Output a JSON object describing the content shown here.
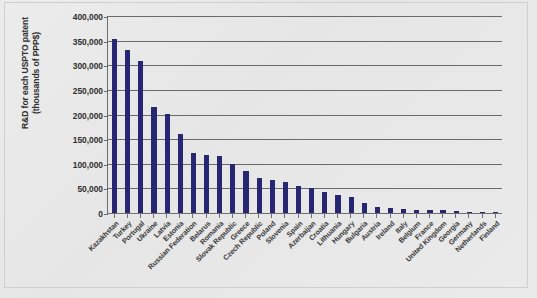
{
  "chart_data": {
    "type": "bar",
    "title": "",
    "xlabel": "",
    "ylabel": "R&D for each USPTO patent (thousands of PPP$)",
    "ylabel_line1": "R&D for each USPTO patent",
    "ylabel_line2": "(thousands of PPP$)",
    "ylim": [
      0,
      400000
    ],
    "ytick_step": 50000,
    "grid": true,
    "legend": "none",
    "bar_color": "#262673",
    "axis_color": "#6a6a6a",
    "ytick_labels": [
      "400,000",
      "350,000",
      "300,000",
      "250,000",
      "200,000",
      "150,000",
      "100,000",
      "50,000",
      "0"
    ],
    "ytick_values": [
      400000,
      350000,
      300000,
      250000,
      200000,
      150000,
      100000,
      50000,
      0
    ],
    "categories": [
      "Kazakhstan",
      "Turkey",
      "Portugal",
      "Ukraine",
      "Latvia",
      "Estonia",
      "Russian Federation",
      "Belarus",
      "Romania",
      "Slovak Republic",
      "Greece",
      "Czech Republic",
      "Poland",
      "Slovenia",
      "Spain",
      "Azerbaijan",
      "Croatia",
      "Lithuania",
      "Hungary",
      "Bulgaria",
      "Austria",
      "Ireland",
      "Italy",
      "Belgium",
      "France",
      "United Kingdom",
      "Georgia",
      "Germany",
      "Netherlands",
      "Finland"
    ],
    "values": [
      354000,
      331000,
      308000,
      215000,
      201000,
      161000,
      121000,
      118000,
      115000,
      100000,
      85000,
      71000,
      68000,
      62000,
      54000,
      51000,
      42000,
      37000,
      32000,
      21000,
      12000,
      10000,
      8000,
      7000,
      7000,
      6000,
      4000,
      3000,
      3000,
      2000
    ]
  }
}
